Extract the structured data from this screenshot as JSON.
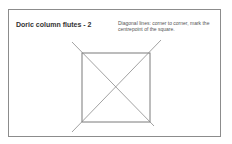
{
  "slide": {
    "title": "Doric column flutes - 2",
    "note": "Diagonal lines: corner to corner, mark the centrepoint of the square.",
    "colors": {
      "frame": "#8c8c8c",
      "lines": "#7a7a7a",
      "text": "#333333"
    },
    "drawing": {
      "square": {
        "x": 82,
        "y": 53,
        "width": 68,
        "height": 69
      },
      "diagonals": [
        {
          "x1": 72,
          "y1": 42,
          "x2": 154,
          "y2": 126
        },
        {
          "x1": 161,
          "y1": 40,
          "x2": 72,
          "y2": 132
        }
      ]
    }
  }
}
